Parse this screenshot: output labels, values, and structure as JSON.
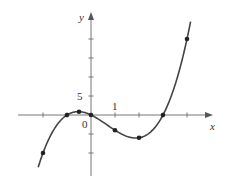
{
  "chart_data": {
    "type": "line",
    "title": "",
    "xlabel": "x",
    "ylabel": "y",
    "function": "y = x^3 - 2x^2 - 3x",
    "tick_labels": {
      "x_unit": "1",
      "y_unit": "5",
      "origin": "0"
    },
    "x_ticks": [
      -2,
      -1,
      1,
      2,
      3,
      4
    ],
    "y_ticks": [
      -10,
      -5,
      5,
      10,
      15,
      20
    ],
    "xlim": [
      -2.2,
      4.15
    ],
    "ylim": [
      -12,
      25
    ],
    "grid": false,
    "points": [
      {
        "x": -2,
        "y": -10
      },
      {
        "x": -1,
        "y": 0
      },
      {
        "x": -0.5,
        "y": 0.875
      },
      {
        "x": 0,
        "y": 0
      },
      {
        "x": 1,
        "y": -4
      },
      {
        "x": 2,
        "y": -6
      },
      {
        "x": 3,
        "y": 0
      },
      {
        "x": 4,
        "y": 20
      }
    ],
    "colors": {
      "curve": "#444444",
      "axes": "#666666",
      "points": "#222222"
    }
  }
}
